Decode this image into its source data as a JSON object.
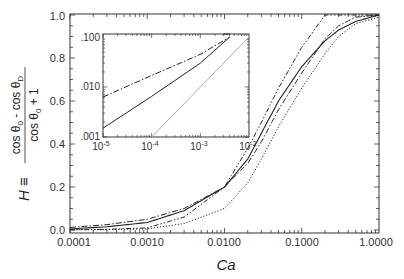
{
  "chart_data": [
    {
      "type": "line",
      "title": "",
      "xlabel": "Ca",
      "ylabel": "H ≡ (cos θ0 − cos θD) / (cos θ0 + 1)",
      "xscale": "log",
      "xlim": [
        0.0001,
        1.0
      ],
      "ylim": [
        0.0,
        1.0
      ],
      "xticks": [
        "0.0001",
        "0.0010",
        "0.0100",
        "0.1000",
        "1.0000"
      ],
      "yticks": [
        "0.0",
        "0.2",
        "0.4",
        "0.6",
        "0.8",
        "1.0"
      ],
      "grid": false,
      "legend": null,
      "x": [
        0.0001,
        0.0003,
        0.001,
        0.003,
        0.01,
        0.02,
        0.03,
        0.05,
        0.1,
        0.2,
        0.3,
        0.5,
        1.0
      ],
      "series": [
        {
          "name": "solid",
          "style": "solid",
          "values": [
            0.005,
            0.015,
            0.035,
            0.09,
            0.2,
            0.33,
            0.45,
            0.6,
            0.76,
            0.88,
            0.93,
            0.97,
            1.0
          ]
        },
        {
          "name": "dash-dot",
          "style": "dash-dot",
          "values": [
            0.012,
            0.025,
            0.05,
            0.1,
            0.2,
            0.31,
            0.41,
            0.56,
            0.73,
            0.89,
            0.95,
            0.99,
            1.0
          ]
        },
        {
          "name": "dash-dot-dot",
          "style": "dash-dot-dot",
          "values": [
            0.001,
            0.003,
            0.01,
            0.06,
            0.2,
            0.38,
            0.5,
            0.66,
            0.85,
            1.0,
            1.0,
            1.0,
            1.0
          ]
        },
        {
          "name": "dotted",
          "style": "dotted",
          "values": [
            0.001,
            0.002,
            0.005,
            0.03,
            0.1,
            0.22,
            0.33,
            0.48,
            0.66,
            0.82,
            0.9,
            0.96,
            0.99
          ]
        }
      ]
    },
    {
      "type": "line",
      "title": "inset",
      "xscale": "log",
      "yscale": "log",
      "xlim": [
        1e-05,
        0.01
      ],
      "ylim": [
        0.001,
        0.1
      ],
      "xticks": [
        "10-5",
        "10-4",
        "10-3",
        "10-2"
      ],
      "yticks": [
        ".001",
        ".010",
        ".100"
      ],
      "series": [
        {
          "name": "dash-dot",
          "style": "dash-dot",
          "points": [
            [
              1e-05,
              0.0063
            ],
            [
              0.0001,
              0.017
            ],
            [
              0.001,
              0.045
            ],
            [
              0.004,
              0.1
            ]
          ]
        },
        {
          "name": "solid",
          "style": "solid",
          "points": [
            [
              1e-05,
              0.0015
            ],
            [
              0.0001,
              0.0065
            ],
            [
              0.001,
              0.03
            ],
            [
              0.004,
              0.1
            ]
          ]
        },
        {
          "name": "dotted-gray",
          "style": "solid-gray",
          "points": [
            [
              0.0001,
              0.001
            ],
            [
              0.001,
              0.01
            ],
            [
              0.01,
              0.1
            ]
          ]
        }
      ]
    }
  ],
  "labels": {
    "xlabel": "Ca",
    "ylabel_H": "H ≡",
    "ylabel_num": "cos θ",
    "ylabel_num_sub0": "0",
    "ylabel_num_minus": " - cos θ",
    "ylabel_num_subD": "D",
    "ylabel_den": "cos θ",
    "ylabel_den_sub0": "0",
    "ylabel_den_plus": " + 1",
    "xticks": [
      "0.0001",
      "0.0010",
      "0.0100",
      "0.1000",
      "1.0000"
    ],
    "yticks": [
      "0.0",
      "0.2",
      "0.4",
      "0.6",
      "0.8",
      "1.0"
    ],
    "inset_xticks": [
      "10",
      "10",
      "10",
      "10"
    ],
    "inset_xexps": [
      "-5",
      "-4",
      "-3",
      "-2"
    ],
    "inset_yticks": [
      ".001",
      ".010",
      ".100"
    ]
  }
}
